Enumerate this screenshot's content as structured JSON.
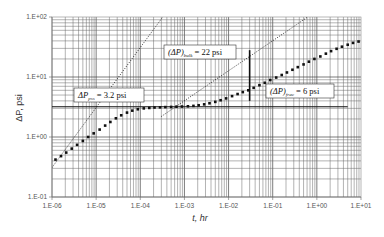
{
  "chart_data": {
    "type": "scatter",
    "title": "",
    "xlabel": "t, hr",
    "ylabel": "ΔP, psi",
    "xscale": "log",
    "yscale": "log",
    "xlim": [
      1e-06,
      10
    ],
    "ylim": [
      0.1,
      100
    ],
    "grid": true,
    "legend": null,
    "x_tick_labels": [
      "1.E-06",
      "1.E-05",
      "1.E-04",
      "1.E-03",
      "1.E-02",
      "1.E-01",
      "1.E+00",
      "1.E+01"
    ],
    "y_tick_labels": [
      "1.E-01",
      "1.E+00",
      "1.E+01",
      "1.E+02"
    ],
    "series": [
      {
        "name": "Pressure change data",
        "style": "markers",
        "x": [
          1.2e-06,
          1.6e-06,
          2.1e-06,
          2.8e-06,
          3.7e-06,
          5e-06,
          6.6e-06,
          8.8e-06,
          1.2e-05,
          1.6e-05,
          2.1e-05,
          2.8e-05,
          3.7e-05,
          5e-05,
          6.6e-05,
          8.8e-05,
          0.00012,
          0.00016,
          0.00021,
          0.00028,
          0.00037,
          0.0005,
          0.00066,
          0.00088,
          0.0012,
          0.0016,
          0.0021,
          0.0028,
          0.0037,
          0.005,
          0.0066,
          0.0088,
          0.012,
          0.016,
          0.021,
          0.028,
          0.037,
          0.05,
          0.066,
          0.088,
          0.12,
          0.16,
          0.21,
          0.28,
          0.37,
          0.5,
          0.66,
          0.88,
          1.2,
          1.6,
          2.1,
          2.8,
          3.7,
          5,
          6.6,
          8.8
        ],
        "y": [
          0.42,
          0.48,
          0.55,
          0.64,
          0.74,
          0.86,
          1.0,
          1.15,
          1.33,
          1.55,
          1.78,
          2.05,
          2.3,
          2.55,
          2.75,
          2.9,
          3.0,
          3.05,
          3.1,
          3.12,
          3.15,
          3.17,
          3.2,
          3.22,
          3.25,
          3.3,
          3.38,
          3.5,
          3.65,
          3.85,
          4.1,
          4.4,
          4.8,
          5.2,
          5.6,
          6.0,
          6.6,
          7.3,
          8.0,
          8.9,
          9.8,
          10.8,
          11.9,
          13.2,
          14.6,
          16.2,
          18.0,
          20.0,
          22.0,
          24.5,
          27.0,
          29.5,
          32.0,
          34.5,
          37.0,
          39.0
        ]
      },
      {
        "name": "Early-time unit slope line",
        "style": "dotted",
        "x": [
          1e-06,
          0.1
        ],
        "y": [
          0.31,
          31000
        ]
      },
      {
        "name": "Late-time half slope line (through 22 psi)",
        "style": "dotted",
        "x": [
          0.0003,
          3.0
        ],
        "y": [
          2.2,
          220
        ]
      },
      {
        "name": "Radial flow line",
        "style": "solid",
        "x": [
          1e-06,
          5.0
        ],
        "y": [
          3.2,
          3.2
        ]
      },
      {
        "name": "Vertical marker",
        "style": "solid",
        "x": [
          0.03,
          0.03
        ],
        "y": [
          4.0,
          28.0
        ]
      }
    ],
    "annotations": [
      {
        "text": "(ΔP)_bulk = 22 psi",
        "x": 0.00013,
        "y": 24
      },
      {
        "text": "(ΔP)_frac = 6 psi",
        "x": 0.05,
        "y": 6.3
      },
      {
        "text": "ΔP_pss = 3.2 psi",
        "x": 1.2e-05,
        "y": 4.0
      }
    ]
  },
  "axes": {
    "xlabel": "t, hr",
    "ylabel": "ΔP, psi"
  },
  "annotations": {
    "bulk": {
      "main": "(ΔP)",
      "sub": "bulk",
      "rest": " = 22 psi"
    },
    "frac": {
      "main": "(ΔP)",
      "sub": "frac",
      "rest": " = 6 psi"
    },
    "pss": {
      "main": "ΔP",
      "sub": "pss",
      "rest": " = 3.2 psi"
    }
  }
}
